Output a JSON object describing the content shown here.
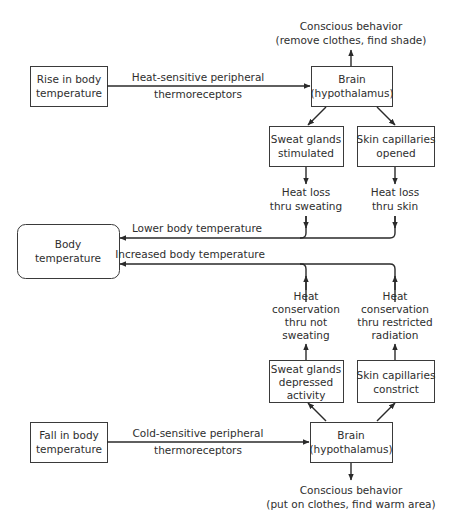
{
  "diagram": {
    "top": {
      "conscious_behavior": {
        "line1": "Conscious behavior",
        "line2": "(remove clothes, find shade)"
      },
      "stimulus": {
        "line1": "Rise in body",
        "line2": "temperature"
      },
      "receptor_label": {
        "line1": "Heat-sensitive peripheral",
        "line2": "thermoreceptors"
      },
      "brain": {
        "line1": "Brain",
        "line2": "(hypothalamus)"
      },
      "sweat_glands": {
        "line1": "Sweat glands",
        "line2": "stimulated"
      },
      "skin_capillaries": {
        "line1": "Skin capillaries",
        "line2": "opened"
      },
      "effect_sweat": {
        "line1": "Heat loss",
        "line2": "thru sweating"
      },
      "effect_skin": {
        "line1": "Heat loss",
        "line2": "thru skin"
      },
      "result_label": "Lower body temperature"
    },
    "center": {
      "body_temperature": {
        "line1": "Body",
        "line2": "temperature"
      }
    },
    "bottom": {
      "result_label": "Increased body temperature",
      "effect_sweat": {
        "line1": "Heat",
        "line2": "conservation",
        "line3": "thru not",
        "line4": "sweating"
      },
      "effect_skin": {
        "line1": "Heat",
        "line2": "conservation",
        "line3": "thru restricted",
        "line4": "radiation"
      },
      "sweat_glands": {
        "line1": "Sweat glands",
        "line2": "depressed",
        "line3": "activity"
      },
      "skin_capillaries": {
        "line1": "Skin capillaries",
        "line2": "constrict"
      },
      "stimulus": {
        "line1": "Fall in body",
        "line2": "temperature"
      },
      "receptor_label": {
        "line1": "Cold-sensitive peripheral",
        "line2": "thermoreceptors"
      },
      "brain": {
        "line1": "Brain",
        "line2": "(hypothalamus)"
      },
      "conscious_behavior": {
        "line1": "Conscious behavior",
        "line2": "(put on clothes, find warm area)"
      }
    }
  }
}
